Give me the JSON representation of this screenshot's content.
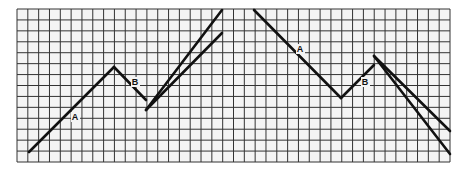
{
  "diagram": {
    "type": "grid-line-diagram",
    "grid": {
      "x0": 17,
      "y0": 9,
      "x1": 450,
      "y1": 162,
      "cols": 40,
      "rows": 14,
      "line_color": "#333333",
      "background": "#f4f4f4"
    },
    "line_color": "#111111",
    "left_panel": {
      "labels": [
        {
          "text": "A",
          "x": 75,
          "y": 120
        },
        {
          "text": "B",
          "x": 135,
          "y": 85
        }
      ],
      "segments": [
        {
          "name": "leg-a",
          "x1": 29,
          "y1": 152,
          "x2": 114,
          "y2": 67
        },
        {
          "name": "leg-b",
          "x1": 114,
          "y1": 67,
          "x2": 146,
          "y2": 100
        },
        {
          "name": "steep-line",
          "x1": 146,
          "y1": 110,
          "x2": 222,
          "y2": 10
        },
        {
          "name": "shallow-line",
          "x1": 146,
          "y1": 110,
          "x2": 222,
          "y2": 33
        }
      ]
    },
    "right_panel": {
      "labels": [
        {
          "text": "A",
          "x": 300,
          "y": 52
        },
        {
          "text": "B",
          "x": 365,
          "y": 85
        }
      ],
      "segments": [
        {
          "name": "leg-a",
          "x1": 254,
          "y1": 10,
          "x2": 341,
          "y2": 98
        },
        {
          "name": "leg-b",
          "x1": 341,
          "y1": 98,
          "x2": 374,
          "y2": 65
        },
        {
          "name": "steep-line",
          "x1": 374,
          "y1": 56,
          "x2": 450,
          "y2": 154
        },
        {
          "name": "shallow-line",
          "x1": 374,
          "y1": 56,
          "x2": 450,
          "y2": 131
        }
      ]
    }
  }
}
